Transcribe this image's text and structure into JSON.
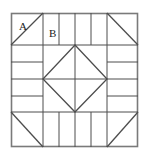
{
  "figure": {
    "kind": "quilt-block-diagram",
    "title": "",
    "background_color": "#ffffff",
    "line_color": "#4d4d4d",
    "outer_border_color": "#737373",
    "label_color": "#1a1a1a"
  },
  "block": {
    "outer_square": {
      "x": 11,
      "y": 13,
      "width": 127,
      "height": 134
    },
    "band_thickness": {
      "top": 32,
      "bottom": 32,
      "left": 32,
      "right": 32
    }
  },
  "labels": [
    {
      "id": "A",
      "text": "A",
      "x": 19,
      "y": 29,
      "piece": "corner-triangle-top-left"
    },
    {
      "id": "B",
      "text": "B",
      "x": 50,
      "y": 36,
      "piece": "strip-top-1"
    }
  ],
  "corner_triangles": [
    {
      "id": "top-left",
      "corner": "top-left",
      "diagonal": "bottom-left-to-top-right"
    },
    {
      "id": "top-right",
      "corner": "top-right",
      "diagonal": "bottom-right-to-top-left"
    },
    {
      "id": "bottom-left",
      "corner": "bottom-left",
      "diagonal": "top-left-to-bottom-right"
    },
    {
      "id": "bottom-right",
      "corner": "bottom-right",
      "diagonal": "top-right-to-bottom-left"
    }
  ],
  "strips": {
    "top": {
      "orientation": "vertical",
      "count": 5,
      "x_positions": [
        43,
        59,
        75,
        91,
        106
      ]
    },
    "bottom": {
      "orientation": "vertical",
      "count": 5,
      "x_positions": [
        43,
        59,
        75,
        91,
        106
      ]
    },
    "left": {
      "orientation": "horizontal",
      "count": 5,
      "y_positions": [
        45,
        62,
        80,
        97,
        115
      ]
    },
    "right": {
      "orientation": "horizontal",
      "count": 5,
      "y_positions": [
        45,
        62,
        80,
        97,
        115
      ]
    }
  },
  "center": {
    "square": {
      "x": 43,
      "y": 45,
      "width": 64,
      "height": 67
    },
    "diamond": {
      "top": {
        "x": 75,
        "y": 45
      },
      "right": {
        "x": 107,
        "y": 79
      },
      "bottom": {
        "x": 75,
        "y": 112
      },
      "left": {
        "x": 43,
        "y": 79
      }
    },
    "cross_lines": [
      "vertical-center",
      "horizontal-center"
    ]
  }
}
